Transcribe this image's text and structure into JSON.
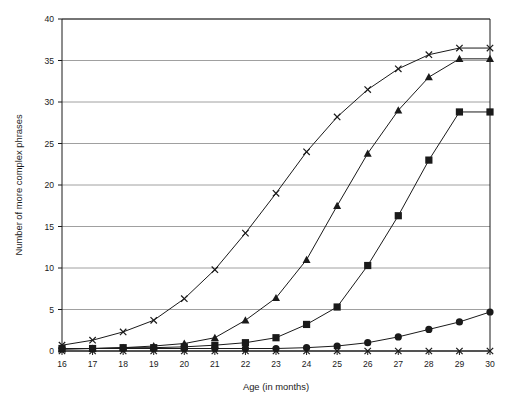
{
  "chart_data": {
    "type": "line",
    "title": "",
    "subtitle": "",
    "xlabel": "Age (in months)",
    "ylabel": "Number of more complex phrases",
    "x": [
      16,
      17,
      18,
      19,
      20,
      21,
      22,
      23,
      24,
      25,
      26,
      27,
      28,
      29,
      30
    ],
    "xlim": [
      16,
      30
    ],
    "ylim": [
      0,
      40
    ],
    "xtick_labels": [
      "16",
      "17",
      "18",
      "19",
      "20",
      "21",
      "22",
      "23",
      "24",
      "25",
      "26",
      "27",
      "28",
      "29",
      "30"
    ],
    "ytick_labels": [
      "0",
      "5",
      "10",
      "15",
      "20",
      "25",
      "30",
      "35",
      "40"
    ],
    "yticks": [
      0,
      5,
      10,
      15,
      20,
      25,
      30,
      35,
      40
    ],
    "grid": "horizontal",
    "legend": "none",
    "series": [
      {
        "name": "cross-series-upper",
        "marker": "cross",
        "values": [
          0.7,
          1.3,
          2.3,
          3.7,
          6.3,
          9.8,
          14.2,
          19.0,
          24.0,
          28.2,
          31.5,
          34.0,
          35.7,
          36.5,
          36.5
        ]
      },
      {
        "name": "triangle-series",
        "marker": "triangle",
        "values": [
          0.2,
          0.3,
          0.4,
          0.6,
          0.9,
          1.6,
          3.7,
          6.4,
          11.0,
          17.5,
          23.8,
          29.0,
          33.0,
          35.2,
          35.2
        ]
      },
      {
        "name": "square-series",
        "marker": "square",
        "values": [
          0.3,
          0.3,
          0.4,
          0.4,
          0.5,
          0.7,
          1.0,
          1.6,
          3.2,
          5.3,
          10.3,
          16.3,
          23.0,
          28.8,
          28.8
        ]
      },
      {
        "name": "circle-series",
        "marker": "circle",
        "values": [
          0.3,
          0.3,
          0.3,
          0.3,
          0.3,
          0.3,
          0.3,
          0.3,
          0.4,
          0.6,
          1.0,
          1.7,
          2.6,
          3.5,
          4.7
        ]
      },
      {
        "name": "cross-series-flat",
        "marker": "cross",
        "values": [
          0.0,
          0.0,
          0.0,
          0.0,
          0.0,
          0.0,
          0.0,
          0.0,
          0.0,
          0.0,
          0.0,
          0.0,
          0.0,
          0.0,
          0.0
        ]
      }
    ]
  },
  "colors": {
    "line": "#1a1a1a",
    "grid": "#888888",
    "axis": "#1a1a1a",
    "background": "#ffffff"
  }
}
